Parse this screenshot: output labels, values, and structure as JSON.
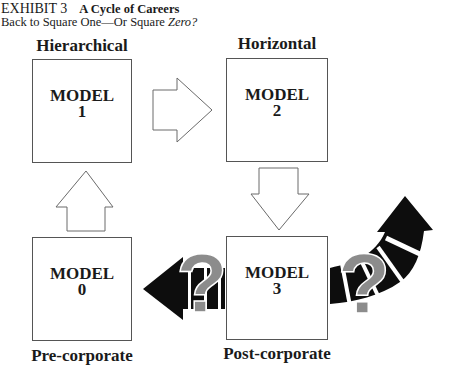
{
  "exhibit": {
    "number": "EXHIBIT 3",
    "title": "A Cycle of Careers",
    "subtitle_prefix": "Back to Square One—Or Square ",
    "subtitle_emph": "Zero?"
  },
  "models": [
    {
      "id": "model-1",
      "word": "MODEL",
      "number": "1",
      "label": "Hierarchical"
    },
    {
      "id": "model-2",
      "word": "MODEL",
      "number": "2",
      "label": "Horizontal"
    },
    {
      "id": "model-3",
      "word": "MODEL",
      "number": "3",
      "label": "Post-corporate"
    },
    {
      "id": "model-0",
      "word": "MODEL",
      "number": "0",
      "label": "Pre-corporate"
    }
  ],
  "arrows": [
    {
      "from": "MODEL 1",
      "to": "MODEL 2",
      "style": "outline",
      "direction": "right"
    },
    {
      "from": "MODEL 2",
      "to": "MODEL 3",
      "style": "outline",
      "direction": "down"
    },
    {
      "from": "MODEL 3",
      "to": "MODEL 0",
      "style": "solid-black",
      "direction": "left",
      "annotation": "?"
    },
    {
      "from": "MODEL 0",
      "to": "MODEL 1",
      "style": "outline",
      "direction": "up"
    },
    {
      "from": "MODEL 3",
      "to": "unknown",
      "style": "solid-black-curved",
      "direction": "up-right",
      "annotation": "?"
    }
  ],
  "question_mark": "?",
  "colors": {
    "outline": "#555555",
    "solid_arrow": "#0d0d0d",
    "question_mark": "#8c8c8c",
    "text": "#1a1a1a"
  }
}
